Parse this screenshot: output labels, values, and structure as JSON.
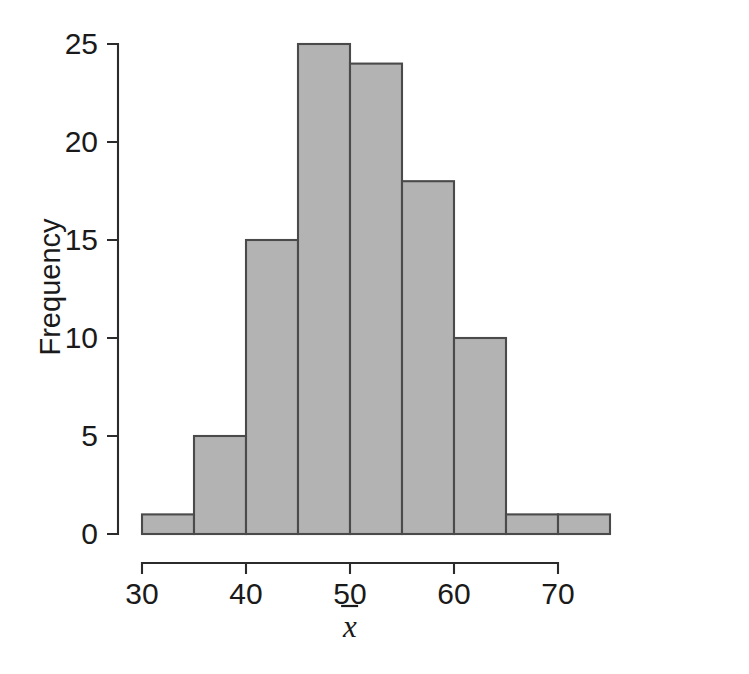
{
  "chart_data": {
    "type": "bar",
    "title": "",
    "subtitle": "",
    "xlabel": "x̄",
    "ylabel": "Frequency",
    "xlim": [
      30,
      75
    ],
    "ylim": [
      0,
      25
    ],
    "grid": false,
    "legend": null,
    "bin_width": 5,
    "bin_edges": [
      30,
      35,
      40,
      45,
      50,
      55,
      60,
      65,
      70,
      75
    ],
    "categories": [
      "30-35",
      "35-40",
      "40-45",
      "45-50",
      "50-55",
      "55-60",
      "60-65",
      "65-70",
      "70-75"
    ],
    "values": [
      1,
      5,
      15,
      25,
      24,
      18,
      10,
      1,
      1
    ],
    "x_ticks": [
      30,
      40,
      50,
      60,
      70
    ],
    "x_tick_labels": [
      "30",
      "40",
      "50",
      "60",
      "70"
    ],
    "y_ticks": [
      0,
      5,
      10,
      15,
      20,
      25
    ],
    "y_tick_labels": [
      "0",
      "5",
      "10",
      "15",
      "20",
      "25"
    ],
    "bar_fill_color": "#b3b3b3",
    "bar_edge_color": "#4a4a4a",
    "axis_color": "#2b2b2b",
    "background_color": "#ffffff"
  },
  "axes": {
    "y_axis_title": "Frequency",
    "x_axis_title": "x̄"
  }
}
